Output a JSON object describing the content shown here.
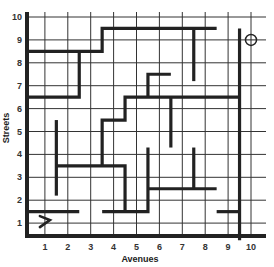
{
  "diagram": {
    "type": "grid-maze",
    "x_axis": {
      "title": "Avenues",
      "ticks": [
        "1",
        "2",
        "3",
        "4",
        "5",
        "6",
        "7",
        "8",
        "9",
        "10"
      ]
    },
    "y_axis": {
      "title": "Streets",
      "ticks": [
        "1",
        "2",
        "3",
        "4",
        "5",
        "6",
        "7",
        "8",
        "9",
        "10"
      ]
    },
    "grid": {
      "min": 0.2,
      "max": 10.6,
      "lines": [
        1,
        2,
        3,
        4,
        5,
        6,
        7,
        8,
        9,
        10
      ]
    },
    "start_marker": {
      "icon": "arrow-right-icon",
      "at": [
        1,
        1
      ]
    },
    "goal_marker": {
      "icon": "circle-target-icon",
      "at": [
        10,
        9
      ]
    },
    "colors": {
      "wall": "#222222",
      "grid": "#333333",
      "background": "#ffffff"
    },
    "walls": [
      [
        [
          0.25,
          8.5
        ],
        [
          3.5,
          8.5
        ],
        [
          3.5,
          9.5
        ],
        [
          8.5,
          9.5
        ]
      ],
      [
        [
          7.5,
          9.5
        ],
        [
          7.5,
          7.2
        ]
      ],
      [
        [
          2.5,
          8.5
        ],
        [
          2.5,
          6.5
        ],
        [
          0.25,
          6.5
        ]
      ],
      [
        [
          6.5,
          7.5
        ],
        [
          5.5,
          7.5
        ],
        [
          5.5,
          6.5
        ]
      ],
      [
        [
          9.5,
          6.5
        ],
        [
          4.5,
          6.5
        ],
        [
          4.5,
          5.5
        ],
        [
          3.5,
          5.5
        ],
        [
          3.5,
          3.5
        ]
      ],
      [
        [
          6.5,
          6.5
        ],
        [
          6.5,
          4.3
        ]
      ],
      [
        [
          1.5,
          5.5
        ],
        [
          1.5,
          2.2
        ]
      ],
      [
        [
          1.5,
          3.5
        ],
        [
          4.5,
          3.5
        ],
        [
          4.5,
          1.5
        ]
      ],
      [
        [
          0.25,
          1.5
        ],
        [
          2.5,
          1.5
        ]
      ],
      [
        [
          3.5,
          1.5
        ],
        [
          5.5,
          1.5
        ],
        [
          5.5,
          4.3
        ]
      ],
      [
        [
          5.5,
          2.5
        ],
        [
          8.5,
          2.5
        ]
      ],
      [
        [
          7.5,
          2.5
        ],
        [
          7.5,
          4.3
        ]
      ],
      [
        [
          8.5,
          1.5
        ],
        [
          9.5,
          1.5
        ]
      ],
      [
        [
          9.5,
          9.5
        ],
        [
          9.5,
          0.25
        ]
      ]
    ]
  }
}
